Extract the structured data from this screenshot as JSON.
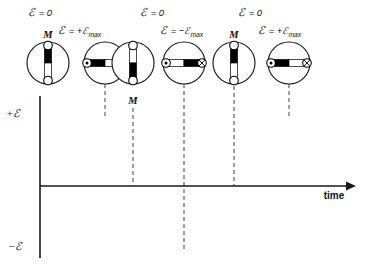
{
  "figure": {
    "background": "#ffffff",
    "ink": "#1a1a1a",
    "dash_color": "#555555"
  },
  "axes": {
    "y_positive_label": "+ℰ",
    "y_negative_label": "−ℰ",
    "x_label": "time",
    "origin": {
      "x": 40,
      "y": 186
    },
    "x_axis_end": {
      "x": 352,
      "y": 186
    },
    "y_axis_top": {
      "x": 40,
      "y": 96
    },
    "y_axis_bottom": {
      "x": 40,
      "y": 258
    }
  },
  "chart_data": {
    "type": "line",
    "xlabel": "time",
    "ylabel": "ℰ",
    "ylim": [
      -1,
      1
    ],
    "xlim": [
      0,
      1.25
    ],
    "grid": false,
    "legend": "none",
    "series": [
      {
        "name": "emf",
        "function": "sin",
        "periods": 1.25,
        "amplitude": 1,
        "phase": 0,
        "x": [
          0,
          0.0625,
          0.125,
          0.1875,
          0.25,
          0.3125,
          0.375,
          0.4375,
          0.5,
          0.5625,
          0.625,
          0.6875,
          0.75,
          0.8125,
          0.875,
          0.9375,
          1.0,
          1.0625,
          1.125,
          1.1875,
          1.25
        ],
        "y": [
          0,
          0.383,
          0.707,
          0.924,
          1.0,
          0.924,
          0.707,
          0.383,
          0,
          -0.383,
          -0.707,
          -0.924,
          -1.0,
          -0.924,
          -0.707,
          -0.383,
          0,
          0.383,
          0.707,
          0.924,
          1.0
        ]
      }
    ],
    "annotations": [
      {
        "label": "ℰ = 0",
        "x": 0.0,
        "y": 0.0
      },
      {
        "label": "ℰ = +ℰmax",
        "x": 0.25,
        "y": 1.0
      },
      {
        "label": "ℰ = 0",
        "x": 0.5,
        "y": 0.0
      },
      {
        "label": "ℰ = −ℰmax",
        "x": 0.75,
        "y": -1.0
      },
      {
        "label": "ℰ = 0",
        "x": 1.0,
        "y": 0.0
      },
      {
        "label": "ℰ = +ℰmax",
        "x": 1.25,
        "y": 1.0
      }
    ]
  },
  "top_labels": [
    {
      "id": "label-1",
      "symbol": "ℰ",
      "eq": " = 0",
      "sub": "",
      "x": 28,
      "y": 16,
      "row": "upper"
    },
    {
      "id": "label-2",
      "symbol": "ℰ",
      "eq": " = +ℰ",
      "sub": "max",
      "x": 58,
      "y": 34,
      "row": "lower"
    },
    {
      "id": "label-3",
      "symbol": "ℰ",
      "eq": " = 0",
      "sub": "",
      "x": 140,
      "y": 16,
      "row": "upper"
    },
    {
      "id": "label-4",
      "symbol": "ℰ",
      "eq": " = −ℰ",
      "sub": "max",
      "x": 160,
      "y": 34,
      "row": "lower"
    },
    {
      "id": "label-5",
      "symbol": "ℰ",
      "eq": " = 0",
      "sub": "",
      "x": 238,
      "y": 16,
      "row": "upper"
    },
    {
      "id": "label-6",
      "symbol": "ℰ",
      "eq": " = +ℰ",
      "sub": "max",
      "x": 258,
      "y": 34,
      "row": "lower"
    }
  ],
  "coils": [
    {
      "id": "coil-1",
      "orientation": "vertical",
      "cx": 48,
      "cy": 63,
      "r": 21,
      "emf_state": "zero",
      "m_label": "M",
      "m_label_position": "above",
      "m_label_x": 48,
      "m_label_y": 36,
      "first_half_fill": "black",
      "second_half_fill": "white",
      "terminal_start": "ring",
      "terminal_end": "ring",
      "dashed_line": false
    },
    {
      "id": "coil-2",
      "orientation": "horizontal",
      "cx": 105,
      "cy": 63,
      "r": 21,
      "emf_state": "positive-max",
      "m_label": "",
      "first_half_fill": "black",
      "second_half_fill": "white",
      "terminal_start": "dot",
      "terminal_end": "cross",
      "dashed_line": true,
      "dash_x": 105,
      "dash_y_top": 84,
      "dash_y_bottom": 118
    },
    {
      "id": "coil-3",
      "orientation": "vertical",
      "cx": 133,
      "cy": 63,
      "r": 21,
      "emf_state": "zero",
      "m_label": "M",
      "m_label_position": "below",
      "m_label_x": 133,
      "m_label_y": 104,
      "first_half_fill": "white",
      "second_half_fill": "black",
      "terminal_start": "ring",
      "terminal_end": "ring",
      "dashed_line": true,
      "dash_x": 133,
      "dash_y_top": 108,
      "dash_y_bottom": 186
    },
    {
      "id": "coil-4",
      "orientation": "horizontal",
      "cx": 184,
      "cy": 63,
      "r": 21,
      "emf_state": "negative-max",
      "m_label": "",
      "first_half_fill": "white",
      "second_half_fill": "black",
      "terminal_start": "dot",
      "terminal_end": "cross",
      "dashed_line": true,
      "dash_x": 184,
      "dash_y_top": 84,
      "dash_y_bottom": 252
    },
    {
      "id": "coil-5",
      "orientation": "vertical",
      "cx": 234,
      "cy": 63,
      "r": 21,
      "emf_state": "zero",
      "m_label": "M",
      "m_label_position": "above",
      "m_label_x": 234,
      "m_label_y": 36,
      "first_half_fill": "black",
      "second_half_fill": "white",
      "terminal_start": "ring",
      "terminal_end": "ring",
      "dashed_line": true,
      "dash_x": 234,
      "dash_y_top": 86,
      "dash_y_bottom": 186
    },
    {
      "id": "coil-6",
      "orientation": "horizontal",
      "cx": 289,
      "cy": 63,
      "r": 21,
      "emf_state": "positive-max",
      "m_label": "",
      "first_half_fill": "black",
      "second_half_fill": "white",
      "terminal_start": "dot",
      "terminal_end": "cross",
      "dashed_line": true,
      "dash_x": 289,
      "dash_y_top": 84,
      "dash_y_bottom": 118
    }
  ]
}
